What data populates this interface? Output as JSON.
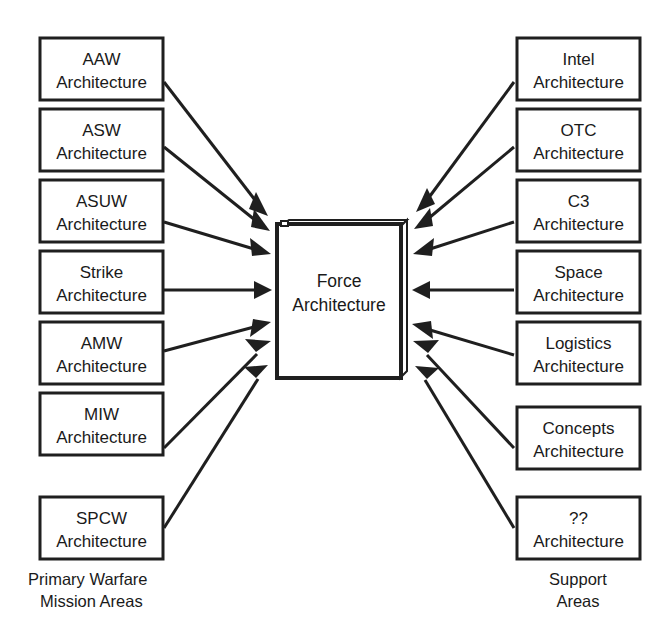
{
  "diagram": {
    "title_center": {
      "line1": "Force",
      "line2": "Architecture"
    },
    "left_group_label": {
      "line1": "Primary Warfare",
      "line2": "Mission Areas"
    },
    "right_group_label": {
      "line1": "Support",
      "line2": "Areas"
    },
    "left_nodes": [
      {
        "line1": "AAW",
        "line2": "Architecture"
      },
      {
        "line1": "ASW",
        "line2": "Architecture"
      },
      {
        "line1": "ASUW",
        "line2": "Architecture"
      },
      {
        "line1": "Strike",
        "line2": "Architecture"
      },
      {
        "line1": "AMW",
        "line2": "Architecture"
      },
      {
        "line1": "MIW",
        "line2": "Architecture"
      },
      {
        "line1": "SPCW",
        "line2": "Architecture"
      }
    ],
    "right_nodes": [
      {
        "line1": "Intel",
        "line2": "Architecture"
      },
      {
        "line1": "OTC",
        "line2": "Architecture"
      },
      {
        "line1": "C3",
        "line2": "Architecture"
      },
      {
        "line1": "Space",
        "line2": "Architecture"
      },
      {
        "line1": "Logistics",
        "line2": "Architecture"
      },
      {
        "line1": "Concepts",
        "line2": "Architecture"
      },
      {
        "line1": "??",
        "line2": "Architecture"
      }
    ],
    "colors": {
      "stroke": "#1f1f1f",
      "fill": "#ffffff",
      "text": "#1a1a1a",
      "background": "#ffffff"
    },
    "geometry": {
      "left_box_x": 40,
      "right_box_x": 517,
      "box_width": 123,
      "box_height": 62,
      "box_pitch": 71,
      "first_box_y": 38,
      "center_box": {
        "x": 277,
        "y": 222,
        "w": 123,
        "h": 156
      }
    }
  }
}
